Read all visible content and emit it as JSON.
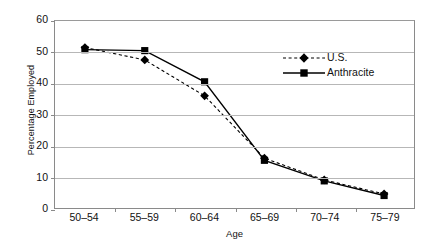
{
  "chart_data": {
    "type": "line",
    "title": "",
    "xlabel": "Age",
    "ylabel": "Percentage Employed",
    "categories": [
      "50–54",
      "55–59",
      "60–64",
      "65–69",
      "70–74",
      "75–79"
    ],
    "ylim": [
      0,
      60
    ],
    "yticks": [
      0,
      10,
      20,
      30,
      40,
      50,
      60
    ],
    "ytick_labels": [
      "0",
      "10",
      "20",
      "30",
      "40",
      "50",
      "60"
    ],
    "grid": "horizontal",
    "legend_position": "inside-upper-right",
    "series": [
      {
        "name": "U.S.",
        "values": [
          51.5,
          47.5,
          36.0,
          16.0,
          9.0,
          4.5
        ],
        "line_style": "dashed",
        "marker": "diamond",
        "color": "#000000"
      },
      {
        "name": "Anthracite",
        "values": [
          50.8,
          50.5,
          40.5,
          15.3,
          8.7,
          4.0
        ],
        "line_style": "solid",
        "marker": "square",
        "color": "#000000"
      }
    ]
  },
  "legend": {
    "items": [
      {
        "label": "U.S."
      },
      {
        "label": "Anthracite"
      }
    ]
  },
  "colors": {
    "grid": "#b7b7b7",
    "axis": "#8a8a8a",
    "ink": "#000000",
    "background": "#ffffff"
  }
}
